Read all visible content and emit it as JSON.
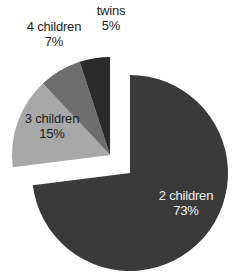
{
  "chart_data": {
    "type": "pie",
    "title": "",
    "subtitle": "",
    "xlabel": "",
    "ylabel": "",
    "legend_position": "none",
    "grid": false,
    "value_unit": "percent",
    "start_angle_deg": 0,
    "direction": "clockwise",
    "categories": [
      "2 children",
      "3 children",
      "4 children",
      "twins"
    ],
    "values": [
      73,
      15,
      7,
      5
    ],
    "labels": [
      "73%",
      "15%",
      "7%",
      "5%"
    ],
    "colors": [
      "#3a3a3a",
      "#a8a8a8",
      "#6e6e6e",
      "#2a2a2a"
    ],
    "exploded": [
      false,
      true,
      true,
      true
    ],
    "slices": [
      {
        "name": "2 children",
        "value": 73,
        "value_label": "73%",
        "color": "#3a3a3a",
        "label_placement": "inside",
        "label_color": "#f2f2f2",
        "exploded": false,
        "start_deg": 0,
        "end_deg": 262.8
      },
      {
        "name": "3 children",
        "value": 15,
        "value_label": "15%",
        "color": "#a8a8a8",
        "label_placement": "inside",
        "label_color": "#1d1d1d",
        "exploded": true,
        "start_deg": 262.8,
        "end_deg": 316.8
      },
      {
        "name": "4 children",
        "value": 7,
        "value_label": "7%",
        "color": "#6e6e6e",
        "label_placement": "outside",
        "label_color": "#1d1d1d",
        "exploded": true,
        "start_deg": 316.8,
        "end_deg": 342.0
      },
      {
        "name": "twins",
        "value": 5,
        "value_label": "5%",
        "color": "#2a2a2a",
        "label_placement": "outside",
        "label_color": "#1d1d1d",
        "exploded": true,
        "start_deg": 342.0,
        "end_deg": 360.0
      }
    ]
  },
  "figure": {
    "background": "#ffffff"
  }
}
